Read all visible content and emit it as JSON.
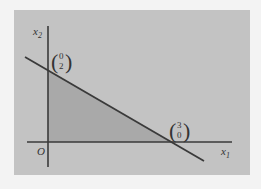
{
  "figure": {
    "type": "feasible-region-diagram",
    "axes": {
      "x_label": "x",
      "x_label_sub": "1",
      "y_label": "x",
      "y_label_sub": "2",
      "origin_label": "O"
    },
    "points": [
      {
        "name": "y-intercept",
        "top": "0",
        "bottom": "2"
      },
      {
        "name": "x-intercept",
        "top": "3",
        "bottom": "0"
      }
    ],
    "constraint_line": {
      "through": [
        [
          0,
          2
        ],
        [
          3,
          0
        ]
      ]
    },
    "shaded_region": "triangle with vertices (0,0), (0,2), (3,0)"
  },
  "colors": {
    "page_background": "#f3f3f3",
    "panel": "#c3c3c3",
    "shaded_region": "#a9a9a9",
    "axes": "#3a3a3a",
    "line": "#3a3a3a"
  }
}
